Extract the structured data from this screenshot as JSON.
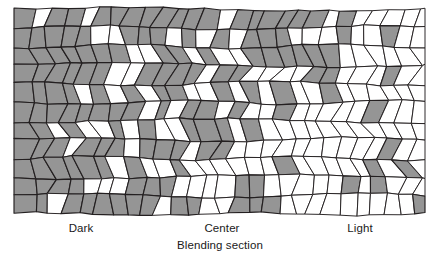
{
  "figure": {
    "name": "blending-section-mosaic",
    "caption": "Blending section",
    "axis_labels": [
      {
        "id": "dark",
        "text": "Dark",
        "x": 81
      },
      {
        "id": "center",
        "text": "Center",
        "x": 222
      },
      {
        "id": "light",
        "text": "Light",
        "x": 360
      }
    ],
    "colors": {
      "dark_cell": "#959595",
      "light_cell": "#ffffff",
      "outline": "#231f20",
      "background": "#ffffff"
    },
    "mosaic": {
      "bounds": {
        "x": 14,
        "y": 9,
        "width": 411,
        "height": 205
      },
      "rows": 11,
      "cells_per_row": 27,
      "description": "Irregular quadrilateral tessellation blending from dark grey cells on the left to white cells on the right"
    },
    "chart_data": {
      "type": "heatmap",
      "title": "",
      "xlabel": "Blending section",
      "ylabel": "",
      "categories": [
        "Dark",
        "Center",
        "Light"
      ],
      "series": [
        {
          "name": "dark-cell-fraction",
          "x": [
            0,
            0.5,
            1
          ],
          "values": [
            1.0,
            0.5,
            0.05
          ]
        }
      ],
      "xlim": [
        0,
        1
      ],
      "ylim": [
        0,
        1
      ],
      "grid": false,
      "legend": "none"
    }
  }
}
